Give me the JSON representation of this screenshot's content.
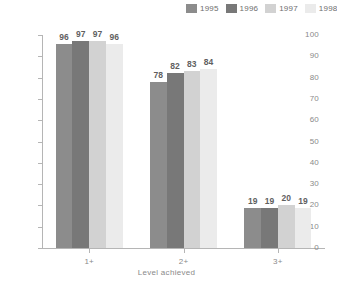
{
  "chart_data": {
    "type": "bar",
    "title": "",
    "subtitle": "",
    "xlabel": "Level achieved",
    "ylabel": "",
    "categories": [
      "1+",
      "2+",
      "3+"
    ],
    "series": [
      {
        "name": "1995",
        "color": "#8c8c8c",
        "values": [
          96,
          78,
          19
        ]
      },
      {
        "name": "1996",
        "color": "#787878",
        "values": [
          97,
          82,
          19
        ]
      },
      {
        "name": "1997",
        "color": "#d2d2d2",
        "values": [
          97,
          83,
          20
        ]
      },
      {
        "name": "1998",
        "color": "#ebebeb",
        "values": [
          96,
          84,
          19
        ]
      }
    ],
    "ylim": [
      0,
      100
    ],
    "ytick_step": 10,
    "yticks": [
      0,
      10,
      20,
      30,
      40,
      50,
      60,
      70,
      80,
      90,
      100
    ],
    "ytick_labels": [
      "0",
      "10",
      "20",
      "30",
      "40",
      "50",
      "60",
      "70",
      "80",
      "90",
      "100"
    ],
    "grid": false,
    "legend_position": "top-right",
    "data_labels": true,
    "axis_color": "#b5b5b5",
    "tick_label_color": "#8a8a8a",
    "data_label_color": "#5f5f5f"
  }
}
